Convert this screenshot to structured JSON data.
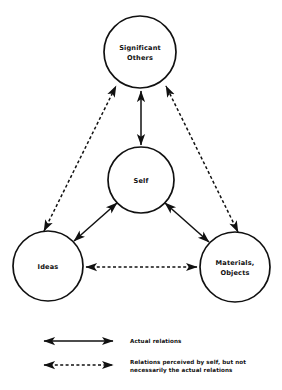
{
  "diagram": {
    "stroke_color": "#111111",
    "background_color": "#ffffff",
    "nodes": [
      {
        "id": "significant-others",
        "label_line1": "Significant",
        "label_line2": "Others",
        "cx": 140,
        "cy": 52,
        "r": 36
      },
      {
        "id": "self",
        "label_line1": "Self",
        "label_line2": "",
        "cx": 141,
        "cy": 180,
        "r": 33
      },
      {
        "id": "ideas",
        "label_line1": "Ideas",
        "label_line2": "",
        "cx": 48,
        "cy": 266,
        "r": 35
      },
      {
        "id": "materials-objects",
        "label_line1": "Materials,",
        "label_line2": "Objects",
        "cx": 235,
        "cy": 267,
        "r": 35
      }
    ],
    "links": [
      {
        "id": "self-to-significant-others",
        "style": "solid",
        "from": "self",
        "to": "significant-others",
        "arrows": "both"
      },
      {
        "id": "self-to-ideas",
        "style": "solid",
        "from": "self",
        "to": "ideas",
        "arrows": "both"
      },
      {
        "id": "self-to-materials",
        "style": "solid",
        "from": "self",
        "to": "materials-objects",
        "arrows": "both"
      },
      {
        "id": "ideas-to-significant-others",
        "style": "dashed",
        "from": "ideas",
        "to": "significant-others",
        "arrows": "both"
      },
      {
        "id": "materials-to-significant-others",
        "style": "dashed",
        "from": "materials-objects",
        "to": "significant-others",
        "arrows": "both"
      },
      {
        "id": "ideas-to-materials",
        "style": "dashed",
        "from": "ideas",
        "to": "materials-objects",
        "arrows": "both"
      }
    ]
  },
  "legend": {
    "items": [
      {
        "id": "actual-relations",
        "style": "solid",
        "line1": "Actual relations",
        "line2": ""
      },
      {
        "id": "perceived-relations",
        "style": "dashed",
        "line1": "Relations perceived by self, but not",
        "line2": "necessarily the actual relations"
      }
    ]
  }
}
